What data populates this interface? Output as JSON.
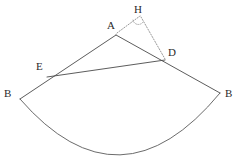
{
  "figure": {
    "background_color": "#ffffff",
    "stroke_color": "#4a4a4a",
    "dotted_stroke_color": "#8a8a8a",
    "label_color": "#2b2b2b",
    "width": 238,
    "height": 164
  },
  "labels": {
    "A": "A",
    "H": "H",
    "D": "D",
    "E": "E",
    "B_left": "B",
    "B_right": "B"
  },
  "label_positions": {
    "A": {
      "x": 107,
      "y": 20
    },
    "H": {
      "x": 134,
      "y": 5
    },
    "D": {
      "x": 168,
      "y": 48
    },
    "E": {
      "x": 36,
      "y": 62
    },
    "B_left": {
      "x": 4,
      "y": 89
    },
    "B_right": {
      "x": 225,
      "y": 89
    }
  },
  "points": {
    "A": {
      "x": 116,
      "y": 35,
      "name": "apex"
    },
    "H": {
      "x": 141,
      "y": 15,
      "name": "foot-of-perpendicular-marker"
    },
    "D": {
      "x": 165,
      "y": 60,
      "name": "point-on-right-radius"
    },
    "E": {
      "x": 47,
      "y": 77,
      "name": "point-on-left-radius"
    },
    "B_left": {
      "x": 20,
      "y": 99,
      "name": "arc-endpoint-left"
    },
    "B_right": {
      "x": 220,
      "y": 93,
      "name": "arc-endpoint-right"
    },
    "arc_bottom": {
      "x": 120,
      "y": 158,
      "name": "arc-lowest-point"
    }
  },
  "segments": [
    {
      "id": "A-Bleft",
      "from": "A",
      "to": "B_left",
      "style": "solid",
      "name": "radius-left"
    },
    {
      "id": "A-Bright",
      "from": "A",
      "to": "B_right",
      "style": "solid",
      "name": "radius-right"
    },
    {
      "id": "E-D",
      "from": "E",
      "to": "D",
      "style": "solid",
      "name": "chord-ed"
    },
    {
      "id": "A-H",
      "from": "A",
      "to": "H",
      "style": "dotted",
      "name": "segment-ah"
    },
    {
      "id": "H-D",
      "from": "H",
      "to": "D",
      "style": "dotted",
      "name": "segment-hd"
    }
  ],
  "arc": {
    "name": "sector-arc",
    "from": "B_left",
    "through": "arc_bottom",
    "to": "B_right",
    "style": "solid"
  },
  "angle_mark": {
    "name": "angle-arc-at-h",
    "vertex_x": 138,
    "vertex_y": 22,
    "radius": 5,
    "style": "dotted"
  },
  "watermark": {
    "text": "",
    "x": 165,
    "y": 145
  }
}
